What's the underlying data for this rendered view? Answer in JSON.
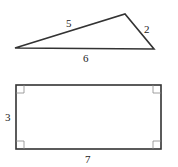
{
  "triangle": {
    "vertices": {
      "left": [
        15,
        48
      ],
      "top": [
        125,
        14
      ],
      "right": [
        154,
        49
      ]
    },
    "sides": {
      "left_top": "5",
      "top_right": "2",
      "bottom": "6"
    }
  },
  "rectangle": {
    "x": 16,
    "y": 85,
    "width": 145,
    "height": 64,
    "sides": {
      "left": "3",
      "bottom": "7"
    },
    "right_angle_marks": 4
  },
  "colors": {
    "stroke": "#333333",
    "mark": "#888888",
    "label": "#222222"
  }
}
